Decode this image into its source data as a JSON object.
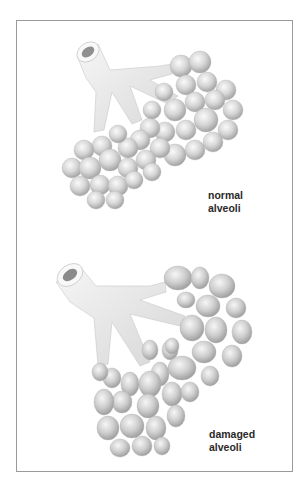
{
  "figure": {
    "panels": [
      {
        "id": "normal",
        "label_line1": "normal",
        "label_line2": "alveoli"
      },
      {
        "id": "damaged",
        "label_line1": "damaged",
        "label_line2": "alveoli"
      }
    ]
  },
  "colors": {
    "border": "#9a9a9a",
    "tissue": "#e9e9e9",
    "alveolus_light": "#f4f4f4",
    "alveolus_dark": "#a8a8a8",
    "text": "#2a2a2a"
  }
}
